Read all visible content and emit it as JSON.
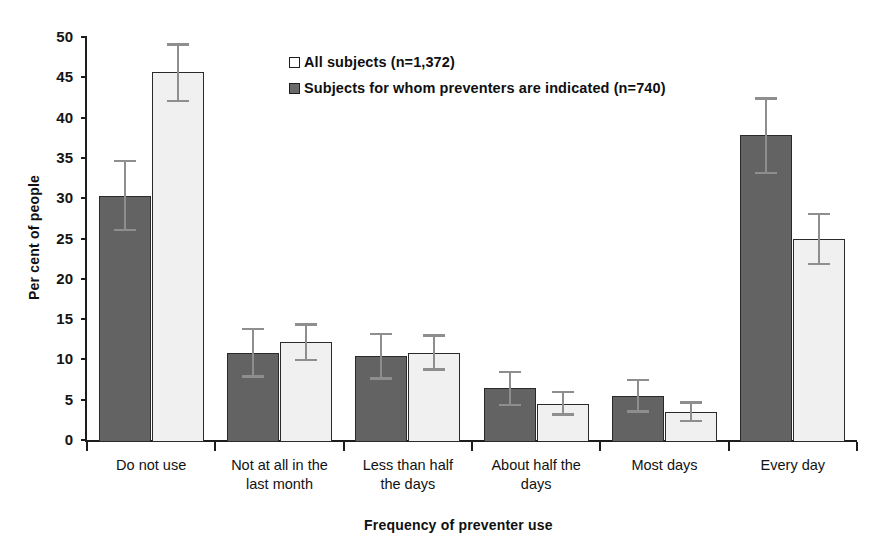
{
  "chart_data": {
    "type": "bar",
    "title": "",
    "xlabel": "Frequency of preventer use",
    "ylabel": "Per cent of people",
    "ylim": [
      0,
      50
    ],
    "yticks": [
      0,
      5,
      10,
      15,
      20,
      25,
      30,
      35,
      40,
      45,
      50
    ],
    "grid": false,
    "legend_position": "top-center",
    "error_bars": "95% confidence interval",
    "categories": [
      "Do not use",
      "Not at all in the last month",
      "Less than half the days",
      "About half the days",
      "Most days",
      "Every day"
    ],
    "category_lines": [
      [
        "Do not use"
      ],
      [
        "Not at all in the",
        "last month"
      ],
      [
        "Less than half",
        "the days"
      ],
      [
        "About half the",
        "days"
      ],
      [
        "Most days"
      ],
      [
        "Every day"
      ]
    ],
    "series": [
      {
        "name": "Subjects for whom preventers are indicated (n=740)",
        "color": "#636363",
        "order_in_group": 0,
        "values": [
          30.3,
          10.8,
          10.4,
          6.4,
          5.5,
          37.8
        ],
        "err_low": [
          25.9,
          7.7,
          7.5,
          4.2,
          3.4,
          33.0
        ],
        "err_high": [
          34.8,
          13.9,
          13.3,
          8.6,
          7.6,
          42.5
        ]
      },
      {
        "name": "All subjects (n=1,372)",
        "color": "#f0f0f0",
        "order_in_group": 1,
        "values": [
          45.6,
          12.2,
          10.8,
          4.5,
          3.5,
          24.9
        ],
        "err_low": [
          41.9,
          9.8,
          8.6,
          3.0,
          2.2,
          21.7
        ],
        "err_high": [
          49.2,
          14.5,
          13.1,
          6.1,
          4.8,
          28.2
        ]
      }
    ]
  },
  "legend": {
    "items": [
      {
        "label": "All subjects (n=1,372)",
        "swatch": "light"
      },
      {
        "label": "Subjects for whom preventers are indicated (n=740)",
        "swatch": "dark"
      }
    ]
  },
  "axes": {
    "y_title": "Per cent of people",
    "x_title": "Frequency of preventer use"
  },
  "colors": {
    "series_dark": "#636363",
    "series_light": "#f0f0f0",
    "axis": "#1d1d1d",
    "error_bar": "#8e8e8e"
  }
}
